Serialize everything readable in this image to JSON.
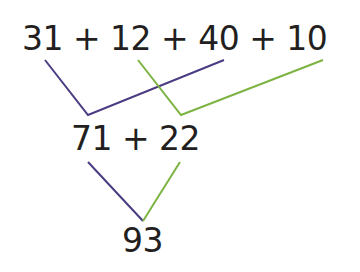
{
  "diagram": {
    "top_expression": "31 + 12 + 40 + 10",
    "middle_expression": "71 + 22",
    "result": "93",
    "groupings": [
      {
        "name": "purple",
        "color": "#4b3b82",
        "joins": [
          "31",
          "40"
        ],
        "sum": "71"
      },
      {
        "name": "green",
        "color": "#7cb342",
        "joins": [
          "12",
          "10"
        ],
        "sum": "22"
      }
    ],
    "final_join": {
      "joins": [
        "71",
        "22"
      ],
      "sum": "93"
    }
  }
}
